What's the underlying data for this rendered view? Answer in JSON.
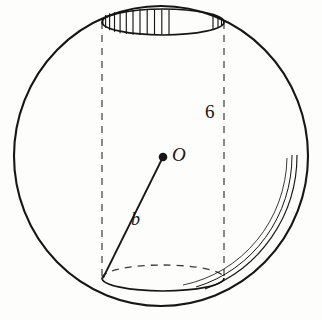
{
  "figure": {
    "background_color": "#fdfdfc",
    "ink_color": "#161616",
    "labels": {
      "center_point": "O",
      "radius": "b",
      "height": "6"
    },
    "icons": {
      "center_dot": "filled-dot-icon"
    },
    "geometry": {
      "sphere": {
        "center_x": 161,
        "center_y": 156,
        "radius_x": 147,
        "radius_y": 150,
        "stroke_width": 2.1
      },
      "cylinder": {
        "center_x": 163,
        "top_y": 22,
        "bottom_y": 278,
        "radius_x": 61,
        "ellipse_radius_y": 13,
        "left_x": 102,
        "right_x": 224
      },
      "radius_line": {
        "x1": 163,
        "y1": 157,
        "x2": 103,
        "y2": 278
      },
      "center_dot": {
        "cx": 163,
        "cy": 157,
        "r": 4.2
      },
      "hatch": {
        "count": 14,
        "start_angle_deg": 176,
        "end_angle_deg": 262
      },
      "shading_arcs": {
        "count": 3,
        "offsets": [
          8,
          13,
          19
        ],
        "start_angle_deg": -63,
        "end_angle_deg": 22
      }
    }
  }
}
